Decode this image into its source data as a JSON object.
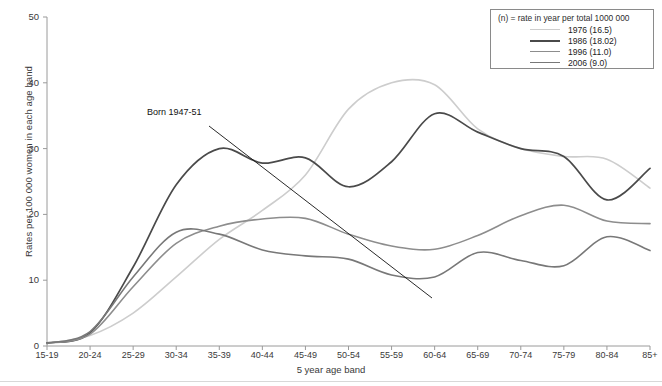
{
  "chart_data": {
    "type": "line",
    "title": "",
    "xlabel": "5 year age band",
    "ylabel": "Rates per 100 000 women in each age band",
    "categories": [
      "15-19",
      "20-24",
      "25-29",
      "30-34",
      "35-39",
      "40-44",
      "45-49",
      "50-54",
      "55-59",
      "60-64",
      "65-69",
      "70-74",
      "75-79",
      "80-84",
      "85+"
    ],
    "ylim": [
      0,
      50
    ],
    "yticks": [
      0,
      10,
      20,
      30,
      40,
      50
    ],
    "grid": false,
    "legend_position": "top-right",
    "legend_title": "(n) = rate in year per total 1000 000",
    "series": [
      {
        "name": "1976 (16.5)",
        "year": "1976",
        "rate": "16.5",
        "color": "#cdcdcd",
        "values": [
          0.4,
          1.6,
          5.0,
          10.5,
          16.2,
          20.6,
          26.0,
          36.0,
          40.0,
          39.7,
          33.0,
          30.0,
          28.8,
          28.4,
          24.0
        ]
      },
      {
        "name": "1986 (18.02)",
        "year": "1986",
        "rate": "18.02",
        "color": "#4a4a4a",
        "values": [
          0.5,
          2.0,
          12.0,
          24.5,
          30.0,
          27.8,
          28.6,
          24.2,
          28.0,
          35.3,
          32.5,
          30.0,
          28.8,
          22.2,
          27.0
        ]
      },
      {
        "name": "1996 (11.0)",
        "year": "1996",
        "rate": "11.0",
        "color": "#8d8d8d",
        "values": [
          0.4,
          1.8,
          9.0,
          15.6,
          18.2,
          19.3,
          19.4,
          17.0,
          15.2,
          14.7,
          16.8,
          19.8,
          21.4,
          19.0,
          18.6
        ]
      },
      {
        "name": "2006 (9.0)",
        "year": "2006",
        "rate": "9.0",
        "color": "#787878",
        "values": [
          0.4,
          2.2,
          10.5,
          17.3,
          17.0,
          14.6,
          13.7,
          13.2,
          10.8,
          10.5,
          14.2,
          13.0,
          12.2,
          16.6,
          14.5
        ]
      }
    ],
    "annotations": [
      {
        "text": "Born 1947-51",
        "x_px": 147,
        "y_px": 121,
        "arrow_from_px": [
          209,
          126
        ],
        "arrow_to_px": [
          432,
          298
        ]
      }
    ]
  },
  "axes": {
    "y_tick_labels": [
      "50",
      "40",
      "30",
      "20",
      "10",
      "0"
    ],
    "x_tick_labels": [
      "15-19",
      "20-24",
      "25-29",
      "30-34",
      "35-39",
      "40-44",
      "45-49",
      "50-54",
      "55-59",
      "60-64",
      "65-69",
      "70-74",
      "75-79",
      "80-84",
      "85+"
    ]
  },
  "legend": {
    "title": "(n) = rate in year per total 1000 000",
    "entries": [
      {
        "label": "1976 (16.5)"
      },
      {
        "label": "1986 (18.02)"
      },
      {
        "label": "1996 (11.0)"
      },
      {
        "label": "2006 (9.0)"
      }
    ]
  }
}
